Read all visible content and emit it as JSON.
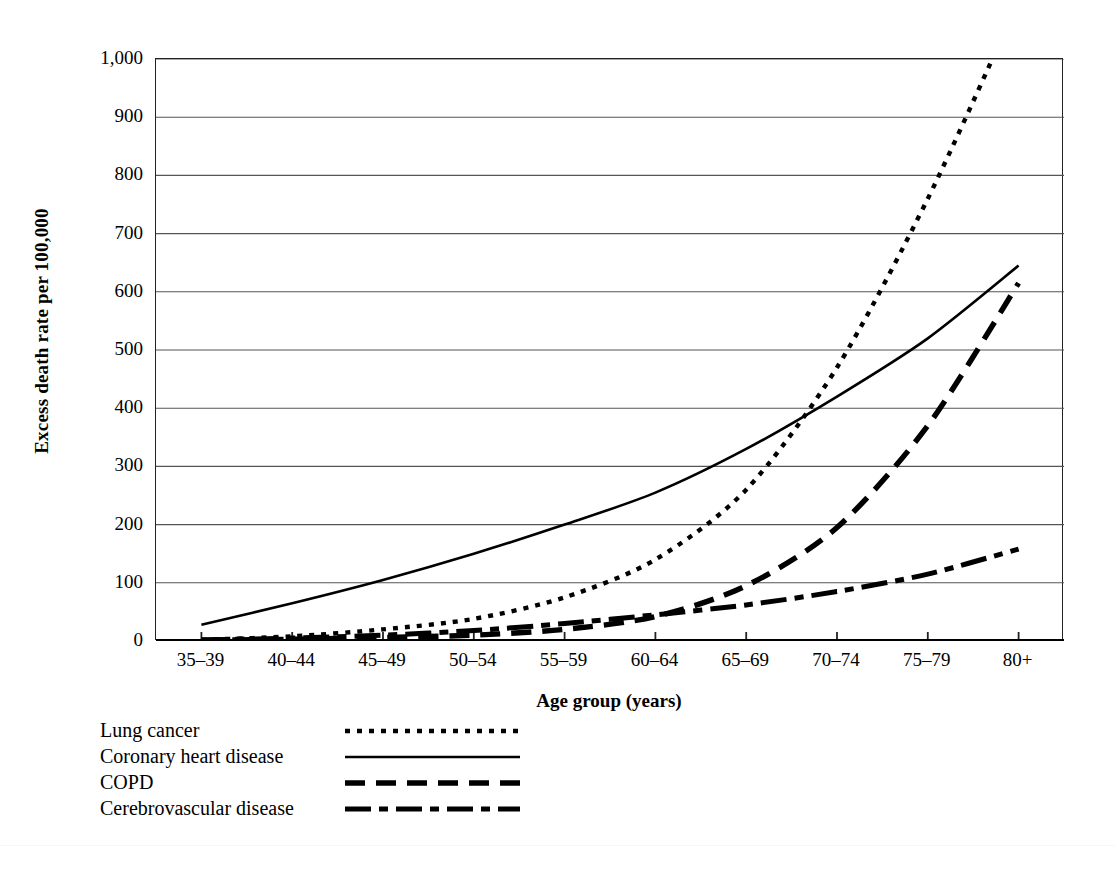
{
  "chart_data": {
    "type": "line",
    "title": "",
    "xlabel": "Age group (years)",
    "ylabel": "Excess death rate per 100,000",
    "categories": [
      "35–39",
      "40–44",
      "45–49",
      "50–54",
      "55–59",
      "60–64",
      "65–69",
      "70–74",
      "75–79",
      "80+"
    ],
    "ylim": [
      0,
      1000
    ],
    "yticks": [
      "0",
      "100",
      "200",
      "300",
      "400",
      "500",
      "600",
      "700",
      "800",
      "900",
      "1,000"
    ],
    "ytick_values": [
      0,
      100,
      200,
      300,
      400,
      500,
      600,
      700,
      800,
      900,
      1000
    ],
    "grid": "horizontal",
    "legend_position": "below-left",
    "series": [
      {
        "name": "Lung cancer",
        "style": "dotted",
        "values": [
          2,
          8,
          20,
          38,
          75,
          140,
          260,
          470,
          760,
          1100
        ],
        "clipped_above_axis_max": true,
        "note": "Exits top of plot area (1,000) between the 70–74 and 75–79 groups"
      },
      {
        "name": "Coronary heart disease",
        "style": "solid",
        "values": [
          28,
          65,
          105,
          150,
          200,
          255,
          330,
          420,
          520,
          645
        ]
      },
      {
        "name": "COPD",
        "style": "dashed",
        "values": [
          1,
          3,
          6,
          10,
          20,
          42,
          95,
          195,
          370,
          615
        ]
      },
      {
        "name": "Cerebrovascular disease",
        "style": "dash-dot",
        "values": [
          2,
          5,
          10,
          18,
          30,
          45,
          62,
          85,
          115,
          158
        ]
      }
    ]
  },
  "legend": {
    "items": [
      {
        "label": "Lung cancer",
        "style": "dotted"
      },
      {
        "label": "Coronary heart disease",
        "style": "solid"
      },
      {
        "label": "COPD",
        "style": "dashed"
      },
      {
        "label": "Cerebrovascular disease",
        "style": "dash-dot"
      }
    ]
  },
  "colors": {
    "ink": "#000000",
    "grid": "#555555",
    "axis": "#222222",
    "background": "#ffffff"
  }
}
